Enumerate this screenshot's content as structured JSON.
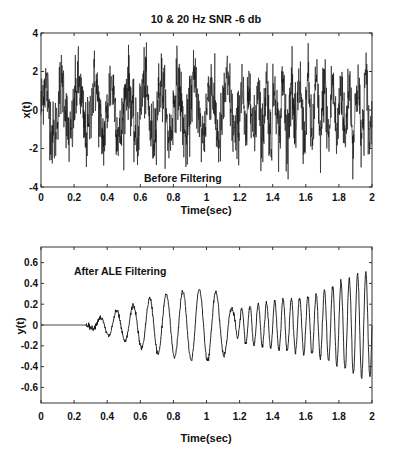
{
  "chart_data": [
    {
      "type": "line",
      "title": "10 & 20 Hz  SNR -6 db",
      "xlabel": "Time(sec)",
      "ylabel": "x(t)",
      "annotation": "Before Filtering",
      "xlim": [
        0,
        2
      ],
      "ylim": [
        -4,
        4
      ],
      "xticks": [
        "0",
        "0.2",
        "0.4",
        "0.6",
        "0.8",
        "1",
        "1.2",
        "1.4",
        "1.6",
        "1.8",
        "2"
      ],
      "yticks": [
        "-4",
        "-2",
        "0",
        "2",
        "4"
      ],
      "grid": false,
      "description": "Noisy signal: 10 Hz sinusoid (0–1.2 s) then 20 Hz sinusoid (1.2–2 s) plus white noise at -6 dB SNR; amplitude mostly within ±2.5, peaks near ±3.6",
      "signal": {
        "freq_first_hz": 10,
        "freq_second_hz": 20,
        "switch_time_s": 1.2,
        "amplitude": 1.0,
        "noise_std": 1.0,
        "peak_max": 3.6,
        "peak_min": -3.6
      }
    },
    {
      "type": "line",
      "title": "",
      "xlabel": "Time(sec)",
      "ylabel": "y(t)",
      "annotation": "After ALE Filtering",
      "xlim": [
        0,
        2
      ],
      "ylim": [
        -0.75,
        0.75
      ],
      "xticks": [
        "0",
        "0.2",
        "0.4",
        "0.6",
        "0.8",
        "1",
        "1.2",
        "1.4",
        "1.6",
        "1.8",
        "2"
      ],
      "yticks": [
        "-0.6",
        "-0.4",
        "-0.2",
        "0",
        "0.2",
        "0.4",
        "0.6"
      ],
      "grid": false,
      "description": "ALE output: zero until ~0.27 s, then 10 Hz oscillation growing to ~±0.35 by 0.8–1.1 s; after 1.2 s switches to 20 Hz, amplitude growing from ~±0.15 to ~±0.5 at 2 s",
      "signal": {
        "start_time_s": 0.27,
        "freq_first_hz": 10,
        "freq_second_hz": 20,
        "switch_time_s": 1.17,
        "envelope_points": [
          [
            0.27,
            0.0
          ],
          [
            0.33,
            0.05
          ],
          [
            0.43,
            0.12
          ],
          [
            0.53,
            0.17
          ],
          [
            0.63,
            0.24
          ],
          [
            0.73,
            0.29
          ],
          [
            0.83,
            0.31
          ],
          [
            0.93,
            0.35
          ],
          [
            1.02,
            0.34
          ],
          [
            1.12,
            0.28
          ],
          [
            1.17,
            0.1
          ],
          [
            1.22,
            0.17
          ],
          [
            1.37,
            0.22
          ],
          [
            1.47,
            0.25
          ],
          [
            1.57,
            0.26
          ],
          [
            1.67,
            0.3
          ],
          [
            1.77,
            0.38
          ],
          [
            1.87,
            0.45
          ],
          [
            1.92,
            0.5
          ],
          [
            2.0,
            0.5
          ]
        ]
      }
    }
  ],
  "plots": {
    "top": {
      "title": "10 & 20 Hz  SNR -6 db",
      "ylabel": "x(t)",
      "xlabel": "Time(sec)",
      "annotation": "Before Filtering"
    },
    "bottom": {
      "ylabel": "y(t)",
      "xlabel": "Time(sec)",
      "annotation": "After ALE Filtering"
    }
  },
  "colors": {
    "line": "#111111",
    "axes": "#333333",
    "background": "#ffffff"
  }
}
